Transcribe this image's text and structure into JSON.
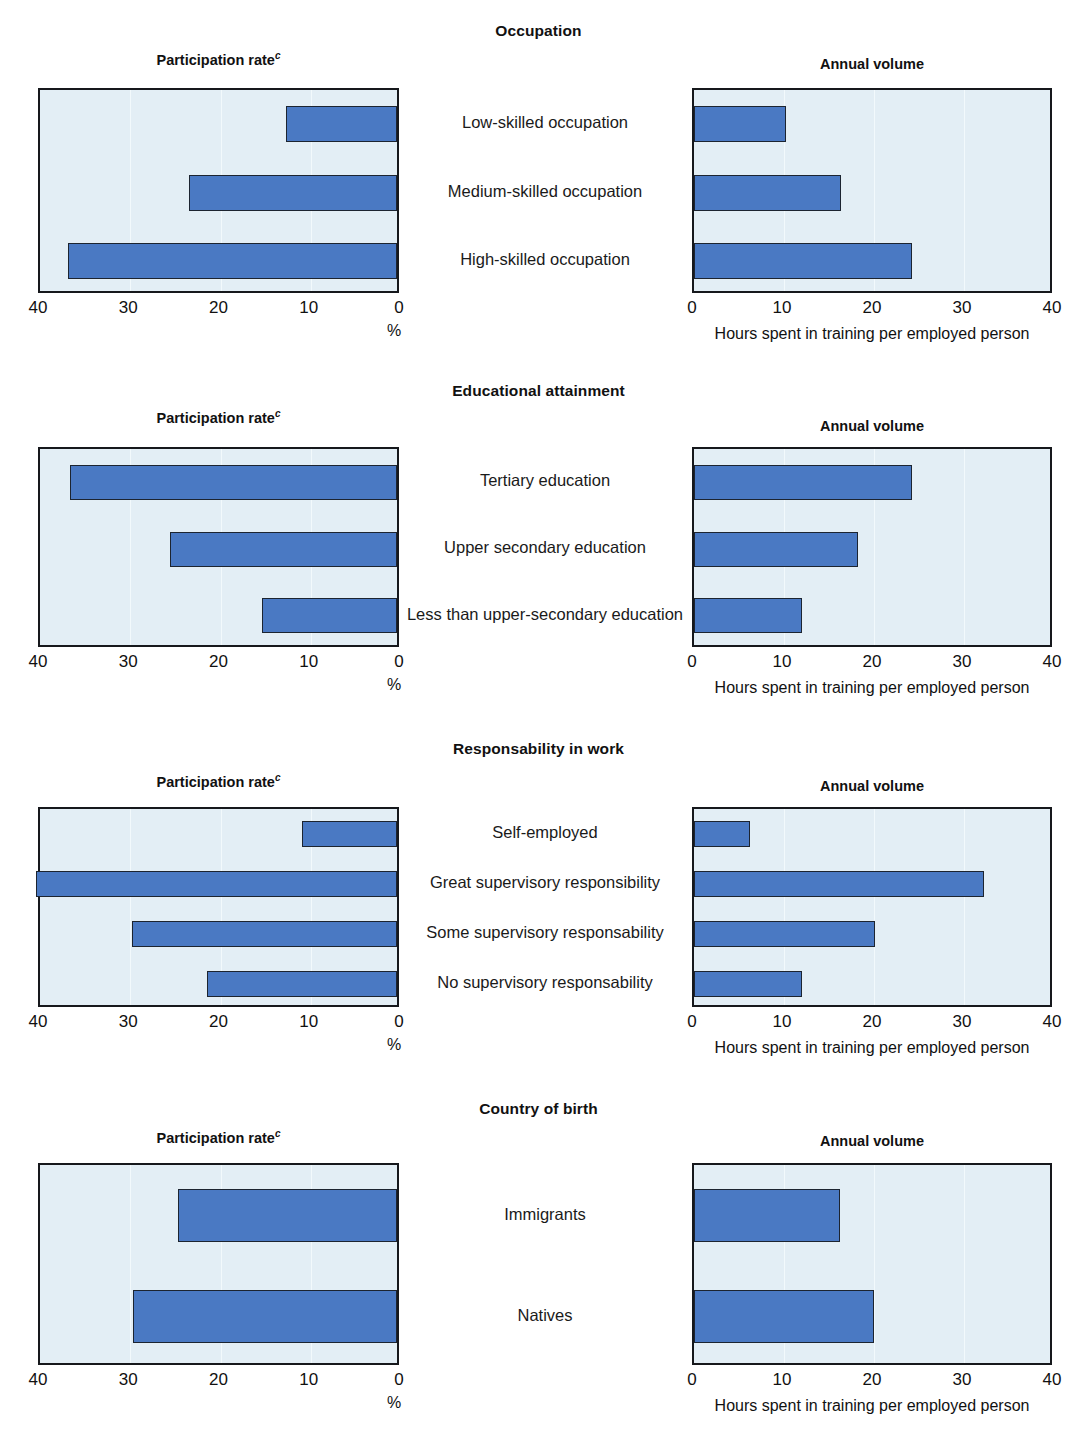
{
  "figure": {
    "left_subtitle": "Participation rate",
    "left_subtitle_superscript": "c",
    "right_subtitle": "Annual volume",
    "left_axis_unit": "%",
    "right_axis_caption": "Hours spent in training per employed person",
    "left_ticks": [
      "40",
      "30",
      "20",
      "10",
      "0"
    ],
    "right_ticks": [
      "0",
      "10",
      "20",
      "30",
      "40"
    ],
    "colors": {
      "bar_fill": "#4a79c3",
      "bar_stroke": "#1c2430",
      "plot_background": "#e3eef5",
      "frame": "#16181c",
      "text": "#1a1a1a"
    }
  },
  "chart_data": [
    {
      "type": "bar",
      "title": "Occupation",
      "orientation": "horizontal",
      "grid": true,
      "categories": [
        "Low-skilled occupation",
        "Medium-skilled occupation",
        "High-skilled occupation"
      ],
      "series": [
        {
          "name": "Participation rate",
          "panel": "left",
          "direction": "right-to-left",
          "xlabel": "%",
          "ylabel": "",
          "xlim": [
            40,
            0
          ],
          "ticks": [
            40,
            30,
            20,
            10,
            0
          ],
          "values": [
            12.3,
            23.0,
            36.5
          ]
        },
        {
          "name": "Annual volume",
          "panel": "right",
          "direction": "left-to-right",
          "xlabel": "Hours spent in training per employed person",
          "ylabel": "",
          "xlim": [
            0,
            40
          ],
          "ticks": [
            0,
            10,
            20,
            30,
            40
          ],
          "values": [
            10.2,
            16.3,
            24.2
          ]
        }
      ]
    },
    {
      "type": "bar",
      "title": "Educational attainment",
      "orientation": "horizontal",
      "grid": true,
      "categories": [
        "Tertiary education",
        "Upper secondary education",
        "Less than upper-secondary education"
      ],
      "series": [
        {
          "name": "Participation rate",
          "panel": "left",
          "direction": "right-to-left",
          "xlabel": "%",
          "ylabel": "",
          "xlim": [
            40,
            0
          ],
          "ticks": [
            40,
            30,
            20,
            10,
            0
          ],
          "values": [
            36.2,
            25.2,
            15.0
          ]
        },
        {
          "name": "Annual volume",
          "panel": "right",
          "direction": "left-to-right",
          "xlabel": "Hours spent in training per employed person",
          "ylabel": "",
          "xlim": [
            0,
            40
          ],
          "ticks": [
            0,
            10,
            20,
            30,
            40
          ],
          "values": [
            24.2,
            18.2,
            12.0
          ]
        }
      ]
    },
    {
      "type": "bar",
      "title": "Responsability in work",
      "orientation": "horizontal",
      "grid": true,
      "categories": [
        "Self-employed",
        "Great supervisory responsibility",
        "Some supervisory responsability",
        "No supervisory responsability"
      ],
      "series": [
        {
          "name": "Participation rate",
          "panel": "left",
          "direction": "right-to-left",
          "xlabel": "%",
          "ylabel": "",
          "xlim": [
            40,
            0
          ],
          "ticks": [
            40,
            30,
            20,
            10,
            0
          ],
          "values": [
            10.5,
            40.0,
            29.4,
            21.0
          ]
        },
        {
          "name": "Annual volume",
          "panel": "right",
          "direction": "left-to-right",
          "xlabel": "Hours spent in training per employed person",
          "ylabel": "",
          "xlim": [
            0,
            40
          ],
          "ticks": [
            0,
            10,
            20,
            30,
            40
          ],
          "values": [
            6.2,
            32.2,
            20.1,
            12.0
          ]
        }
      ]
    },
    {
      "type": "bar",
      "title": "Country of birth",
      "orientation": "horizontal",
      "grid": true,
      "categories": [
        "Immigrants",
        "Natives"
      ],
      "series": [
        {
          "name": "Participation rate",
          "panel": "left",
          "direction": "right-to-left",
          "xlabel": "%",
          "ylabel": "",
          "xlim": [
            40,
            0
          ],
          "ticks": [
            40,
            30,
            20,
            10,
            0
          ],
          "values": [
            24.3,
            29.2
          ]
        },
        {
          "name": "Annual volume",
          "panel": "right",
          "direction": "left-to-right",
          "xlabel": "Hours spent in training per employed person",
          "ylabel": "",
          "xlim": [
            0,
            40
          ],
          "ticks": [
            0,
            10,
            20,
            30,
            40
          ],
          "values": [
            16.2,
            20.0
          ]
        }
      ]
    }
  ]
}
